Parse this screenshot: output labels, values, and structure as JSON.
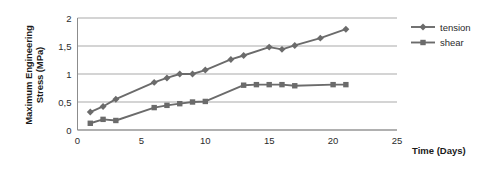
{
  "chart_data": {
    "type": "line",
    "title": "",
    "xlabel": "Time (Days)",
    "ylabel_line1": "Maximum Engineering",
    "ylabel_line2": "Stress (MPa)",
    "ylabel": "Maximum Engineering Stress (MPa)",
    "xlim": [
      0,
      25
    ],
    "ylim": [
      0,
      2
    ],
    "xticks": [
      0,
      5,
      10,
      15,
      20,
      25
    ],
    "xtick_labels": [
      "0",
      "5",
      "10",
      "15",
      "20",
      "25"
    ],
    "yticks": [
      0,
      0.5,
      1,
      1.5,
      2
    ],
    "ytick_labels": [
      "0",
      "0,5",
      "1",
      "1,5",
      "2"
    ],
    "grid": "horizontal",
    "legend_position": "right",
    "series": [
      {
        "name": "tension",
        "marker": "diamond",
        "color": "#6b6b6b",
        "x": [
          1,
          2,
          3,
          6,
          7,
          8,
          9,
          10,
          12,
          13,
          15,
          16,
          17,
          19,
          21
        ],
        "values": [
          0.32,
          0.42,
          0.55,
          0.85,
          0.93,
          1.0,
          1.0,
          1.07,
          1.26,
          1.33,
          1.48,
          1.44,
          1.51,
          1.64,
          1.8
        ]
      },
      {
        "name": "shear",
        "marker": "square",
        "color": "#6b6b6b",
        "x": [
          1,
          2,
          3,
          6,
          7,
          8,
          9,
          10,
          13,
          14,
          15,
          16,
          17,
          20,
          21
        ],
        "values": [
          0.12,
          0.19,
          0.17,
          0.4,
          0.44,
          0.47,
          0.5,
          0.51,
          0.8,
          0.81,
          0.81,
          0.81,
          0.79,
          0.81,
          0.81
        ]
      }
    ]
  },
  "legend": {
    "items": [
      {
        "label": "tension"
      },
      {
        "label": "shear"
      }
    ]
  },
  "axis_label_x": "Time (Days)"
}
